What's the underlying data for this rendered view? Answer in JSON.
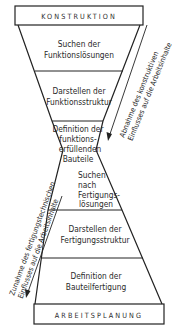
{
  "diagram": {
    "type": "hourglass-process-flow",
    "top_box": {
      "label": "KONSTRUKTION"
    },
    "bottom_box": {
      "label": "ARBEITSPLANUNG"
    },
    "stages": [
      {
        "id": "s1",
        "lines": [
          "Suchen der",
          "Funktionslösungen"
        ]
      },
      {
        "id": "s2",
        "lines": [
          "Darstellen der",
          "Funktionsstruktur"
        ]
      },
      {
        "id": "s3",
        "lines": [
          "Definition der",
          "funktions-",
          "erfüllenden",
          "Bauteile"
        ]
      },
      {
        "id": "s4",
        "lines": [
          "Suchen",
          "nach",
          "Fertigungs-",
          "lösungen"
        ]
      },
      {
        "id": "s5",
        "lines": [
          "Darstellen der",
          "Fertigungsstruktur"
        ]
      },
      {
        "id": "s6",
        "lines": [
          "Definition der",
          "Bauteilfertigung"
        ]
      }
    ],
    "right_annotation": {
      "lines": [
        "Abnahme des konstruktiven",
        "Einflusses auf die Arbeitsinhalte"
      ],
      "arrow": "down"
    },
    "left_annotation": {
      "lines": [
        "Zunahme des fertigungstechnischen",
        "Einflusses auf die Arbeitsinhalte"
      ],
      "arrow": "down"
    },
    "colors": {
      "line": "#222222",
      "text": "#2a2a2a",
      "background": "#ffffff"
    }
  }
}
